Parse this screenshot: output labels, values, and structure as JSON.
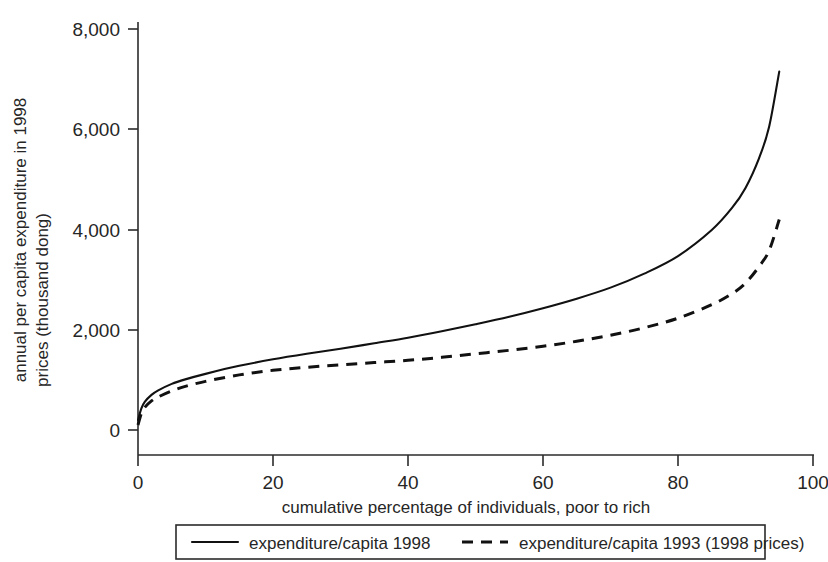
{
  "chart_data": {
    "type": "line",
    "title": "",
    "xlabel": "cumulative percentage of individuals, poor to rich",
    "ylabel_line1": "annual per capita expenditure in 1998",
    "ylabel_line2": "prices (thousand dong)",
    "xlim": [
      0,
      100
    ],
    "ylim": [
      0,
      8000
    ],
    "grid": false,
    "legend_position": "bottom",
    "xticks": [
      0,
      20,
      40,
      60,
      80,
      100
    ],
    "xtick_labels": [
      "0",
      "20",
      "40",
      "60",
      "80",
      "100"
    ],
    "yticks": [
      0,
      2000,
      4000,
      6000,
      8000
    ],
    "ytick_labels": [
      "0",
      "2,000",
      "4,000",
      "6,000",
      "8,000"
    ],
    "series": [
      {
        "name": "expenditure/capita 1998",
        "style": "solid",
        "color": "#111111",
        "x": [
          0,
          0.5,
          1,
          2,
          3,
          5,
          7,
          10,
          15,
          20,
          25,
          30,
          35,
          40,
          45,
          50,
          55,
          60,
          65,
          70,
          75,
          80,
          85,
          88,
          90,
          92,
          93.5,
          95
        ],
        "values": [
          200,
          430,
          560,
          700,
          790,
          920,
          1010,
          1120,
          1280,
          1410,
          1520,
          1620,
          1730,
          1840,
          1970,
          2110,
          2260,
          2430,
          2620,
          2840,
          3120,
          3470,
          3990,
          4430,
          4830,
          5420,
          6050,
          7150
        ]
      },
      {
        "name": "expenditure/capita 1993 (1998 prices)",
        "style": "dashed",
        "color": "#111111",
        "x": [
          0,
          0.5,
          1,
          2,
          3,
          5,
          7,
          10,
          15,
          20,
          25,
          30,
          35,
          40,
          45,
          50,
          55,
          60,
          65,
          70,
          75,
          80,
          85,
          88,
          90,
          92,
          93.5,
          95
        ],
        "values": [
          100,
          330,
          450,
          580,
          660,
          780,
          870,
          970,
          1100,
          1190,
          1250,
          1300,
          1345,
          1390,
          1450,
          1520,
          1590,
          1670,
          1770,
          1890,
          2040,
          2230,
          2500,
          2720,
          2930,
          3260,
          3580,
          4200
        ]
      }
    ],
    "legend": [
      {
        "label": "expenditure/capita 1998",
        "style": "solid"
      },
      {
        "label": "expenditure/capita 1993 (1998 prices)",
        "style": "dashed"
      }
    ]
  }
}
